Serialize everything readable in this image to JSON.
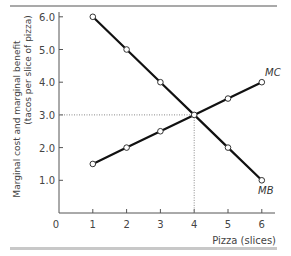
{
  "chart_data": {
    "type": "line",
    "title": "",
    "xlabel": "Pizza (slices)",
    "ylabel_line1": "Marginal cost and marginal benefit",
    "ylabel_line2": "(tacos per slice of  pizza)",
    "x_ticks": [
      "1",
      "2",
      "3",
      "4",
      "5",
      "6"
    ],
    "x_origin_label": "0",
    "y_ticks": [
      "1.0",
      "2.0",
      "3.0",
      "4.0",
      "5.0",
      "6.0"
    ],
    "xlim": [
      0,
      6.3
    ],
    "ylim": [
      0,
      6.0
    ],
    "grid": false,
    "x": [
      1,
      2,
      3,
      4,
      5,
      6
    ],
    "series": [
      {
        "name": "MB",
        "values": [
          6.0,
          5.0,
          4.0,
          3.0,
          2.0,
          1.0
        ]
      },
      {
        "name": "MC",
        "values": [
          1.5,
          2.0,
          2.5,
          3.0,
          3.5,
          4.0
        ]
      }
    ],
    "annotations": [
      {
        "type": "dotted-guide",
        "x": 4,
        "y": 3.0,
        "description": "equilibrium where MB = MC"
      }
    ],
    "labels": {
      "mc": "MC",
      "mb": "MB"
    }
  },
  "colors": {
    "line": "#111111",
    "axis": "#555555",
    "text": "#444444",
    "guide": "#888888",
    "bottom_bar": "#c8c8c8"
  }
}
